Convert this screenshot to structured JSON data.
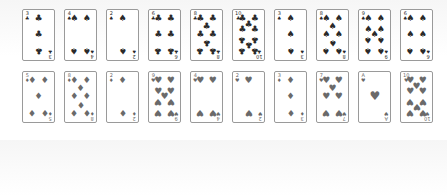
{
  "colors": {
    "black_suit": "#2a2a2a",
    "red_suit": "#6a6a6a",
    "card_border": "#9a9a9a",
    "card_bg": "#ffffff"
  },
  "rows": [
    {
      "name": "top",
      "cards": [
        {
          "rank": "3",
          "suit": "clubs",
          "symbol": "♣"
        },
        {
          "rank": "4",
          "suit": "spades",
          "symbol": "♠"
        },
        {
          "rank": "2",
          "suit": "spades",
          "symbol": "♠"
        },
        {
          "rank": "6",
          "suit": "clubs",
          "symbol": "♣"
        },
        {
          "rank": "8",
          "suit": "clubs",
          "symbol": "♣"
        },
        {
          "rank": "10",
          "suit": "clubs",
          "symbol": "♣"
        },
        {
          "rank": "3",
          "suit": "spades",
          "symbol": "♠"
        },
        {
          "rank": "8",
          "suit": "spades",
          "symbol": "♠"
        },
        {
          "rank": "9",
          "suit": "spades",
          "symbol": "♠"
        },
        {
          "rank": "6",
          "suit": "spades",
          "symbol": "♠"
        }
      ]
    },
    {
      "name": "bottom",
      "cards": [
        {
          "rank": "5",
          "suit": "diamonds",
          "symbol": "♦"
        },
        {
          "rank": "8",
          "suit": "diamonds",
          "symbol": "♦"
        },
        {
          "rank": "2",
          "suit": "diamonds",
          "symbol": "♦"
        },
        {
          "rank": "9",
          "suit": "hearts",
          "symbol": "♥"
        },
        {
          "rank": "4",
          "suit": "hearts",
          "symbol": "♥"
        },
        {
          "rank": "2",
          "suit": "hearts",
          "symbol": "♥"
        },
        {
          "rank": "3",
          "suit": "diamonds",
          "symbol": "♦"
        },
        {
          "rank": "7",
          "suit": "hearts",
          "symbol": "♥"
        },
        {
          "rank": "A",
          "suit": "hearts",
          "symbol": "♥"
        },
        {
          "rank": "10",
          "suit": "hearts",
          "symbol": "♥"
        }
      ]
    }
  ]
}
